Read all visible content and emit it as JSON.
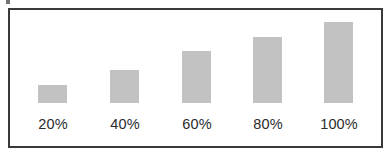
{
  "frame": {
    "border_color": "#3a3a3a",
    "background_color": "#ffffff"
  },
  "chart_data": {
    "type": "bar",
    "title": "",
    "subtitle": "",
    "xlabel": "",
    "ylabel": "",
    "categories": [
      "20%",
      "40%",
      "60%",
      "80%",
      "100%"
    ],
    "values": [
      18,
      33,
      52,
      66,
      81
    ],
    "value_unit": "px-bar-height",
    "tick_labels": [
      "20%",
      "40%",
      "60%",
      "80%",
      "100%"
    ],
    "legend": [],
    "legend_position": "none",
    "grid": false,
    "axis_visible": false,
    "bar_color": "#c2c2c2",
    "bar_width_px": 29,
    "baseline_y_px": 105,
    "ylim": [
      0,
      90
    ],
    "annotations": []
  },
  "bars": [
    {
      "label": "20%",
      "height_px": 18,
      "left_px": 28,
      "label_left_px": 13
    },
    {
      "label": "40%",
      "height_px": 33,
      "left_px": 100,
      "label_left_px": 85
    },
    {
      "label": "60%",
      "height_px": 52,
      "left_px": 172,
      "label_left_px": 157
    },
    {
      "label": "80%",
      "height_px": 66,
      "left_px": 243,
      "label_left_px": 228
    },
    {
      "label": "100%",
      "height_px": 81,
      "left_px": 314,
      "label_left_px": 299
    }
  ]
}
